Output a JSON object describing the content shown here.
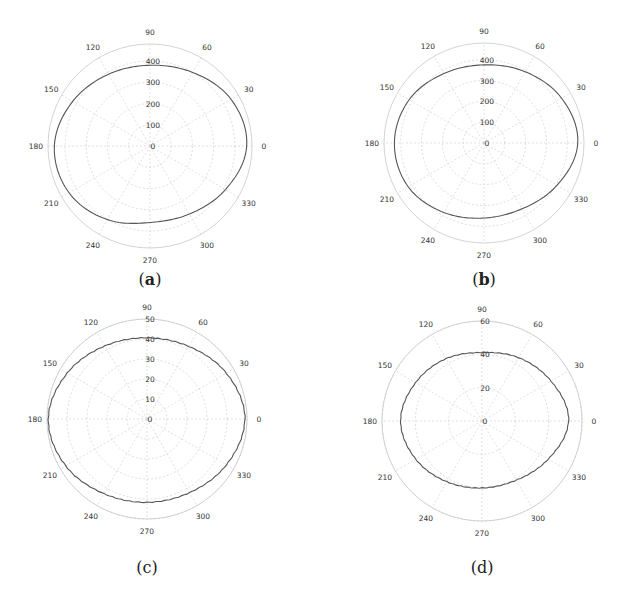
{
  "figure": {
    "panels": [
      {
        "id": "a",
        "caption": "a"
      },
      {
        "id": "b",
        "caption": "b"
      },
      {
        "id": "c",
        "caption": "c"
      },
      {
        "id": "d",
        "caption": "d"
      }
    ]
  },
  "chart_data": [
    {
      "type": "line",
      "subtype": "polar",
      "title": "(a)",
      "angle_ticks_deg": [
        0,
        30,
        60,
        90,
        120,
        150,
        180,
        210,
        240,
        270,
        300,
        330
      ],
      "radial_ticks": [
        0,
        100,
        200,
        300,
        400
      ],
      "rlim": [
        0,
        480
      ],
      "grid": true,
      "center_px": [
        150,
        146
      ],
      "outer_radius_px": 102,
      "series": [
        {
          "name": "pattern",
          "theta_deg": [
            0,
            30,
            60,
            90,
            120,
            150,
            180,
            210,
            240,
            270,
            300,
            330,
            360
          ],
          "r": [
            455,
            440,
            400,
            380,
            390,
            420,
            450,
            440,
            400,
            360,
            370,
            410,
            455
          ]
        }
      ]
    },
    {
      "type": "line",
      "subtype": "polar",
      "title": "(b)",
      "angle_ticks_deg": [
        0,
        30,
        60,
        90,
        120,
        150,
        180,
        210,
        240,
        270,
        300,
        330
      ],
      "radial_ticks": [
        0,
        100,
        200,
        300,
        400
      ],
      "rlim": [
        0,
        480
      ],
      "grid": true,
      "center_px": [
        484,
        143
      ],
      "outer_radius_px": 100,
      "series": [
        {
          "name": "pattern",
          "theta_deg": [
            0,
            30,
            60,
            90,
            120,
            150,
            180,
            210,
            240,
            270,
            300,
            330,
            360
          ],
          "r": [
            450,
            430,
            395,
            375,
            385,
            415,
            430,
            420,
            385,
            360,
            365,
            405,
            450
          ]
        }
      ]
    },
    {
      "type": "line",
      "subtype": "polar",
      "title": "(c)",
      "angle_ticks_deg": [
        0,
        30,
        60,
        90,
        120,
        150,
        180,
        210,
        240,
        270,
        300,
        330
      ],
      "radial_ticks": [
        0,
        10,
        20,
        30,
        40,
        50
      ],
      "rlim": [
        0,
        50
      ],
      "grid": true,
      "center_px": [
        147,
        419
      ],
      "outer_radius_px": 100,
      "series": [
        {
          "name": "pattern",
          "theta_deg": [
            0,
            30,
            60,
            90,
            120,
            150,
            180,
            210,
            240,
            270,
            300,
            330,
            360
          ],
          "r": [
            49,
            46,
            42,
            40.5,
            42,
            46,
            49.5,
            47,
            43,
            41.5,
            42.5,
            46,
            49
          ]
        }
      ]
    },
    {
      "type": "line",
      "subtype": "polar",
      "title": "(d)",
      "angle_ticks_deg": [
        0,
        30,
        60,
        90,
        120,
        150,
        180,
        210,
        240,
        270,
        300,
        330
      ],
      "radial_ticks": [
        0,
        20,
        40,
        60
      ],
      "rlim": [
        0,
        60
      ],
      "grid": true,
      "center_px": [
        482,
        421
      ],
      "outer_radius_px": 100,
      "series": [
        {
          "name": "pattern",
          "theta_deg": [
            0,
            30,
            60,
            90,
            120,
            150,
            180,
            210,
            240,
            270,
            300,
            330,
            360
          ],
          "r": [
            52,
            48,
            44,
            41,
            43,
            46,
            49,
            46,
            42,
            40,
            41,
            46,
            52
          ]
        }
      ]
    }
  ]
}
